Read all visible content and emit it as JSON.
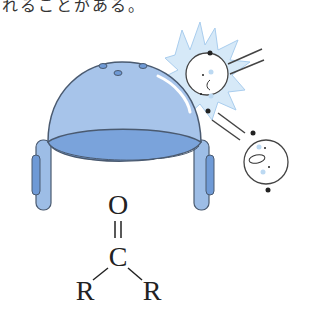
{
  "caption": {
    "text": "れることがある。"
  },
  "diagram": {
    "receptor": {
      "label": "receptor-dome",
      "fill_color": "#9dbde6",
      "inner_color": "#6f9ad6",
      "outline_color": "#4a5a70"
    },
    "molecule": {
      "top_atom": "O",
      "double_bond": "=",
      "center_atom": "C",
      "left_group": "R",
      "right_group": "R"
    },
    "bounced_molecules": [
      {
        "name": "odorant-molecule-hit",
        "expression": "worried"
      },
      {
        "name": "odorant-molecule-rebound",
        "expression": "surprised"
      }
    ],
    "impact_color": "#bcd9f2"
  }
}
